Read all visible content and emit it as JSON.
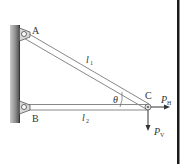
{
  "diagram": {
    "type": "two-bar truss",
    "points": {
      "A": {
        "label": "A",
        "x": 24,
        "y": 34
      },
      "B": {
        "label": "B",
        "x": 24,
        "y": 108
      },
      "C": {
        "label": "C",
        "x": 148,
        "y": 107
      }
    },
    "members": [
      {
        "name": "bar-AC",
        "label": "l",
        "subscript": "1",
        "from": "A",
        "to": "C"
      },
      {
        "name": "bar-BC",
        "label": "l",
        "subscript": "2",
        "from": "B",
        "to": "C"
      }
    ],
    "angle": {
      "label": "θ",
      "at": "C"
    },
    "loads": [
      {
        "name": "horizontal-load",
        "label": "P",
        "subscript": "H",
        "direction": "right"
      },
      {
        "name": "vertical-load",
        "label": "P",
        "subscript": "V",
        "direction": "down"
      }
    ],
    "colors": {
      "wall": "#8a8a8a",
      "bar_stroke": "#888888",
      "text": "#333333",
      "border": "#1a1a1a"
    }
  }
}
